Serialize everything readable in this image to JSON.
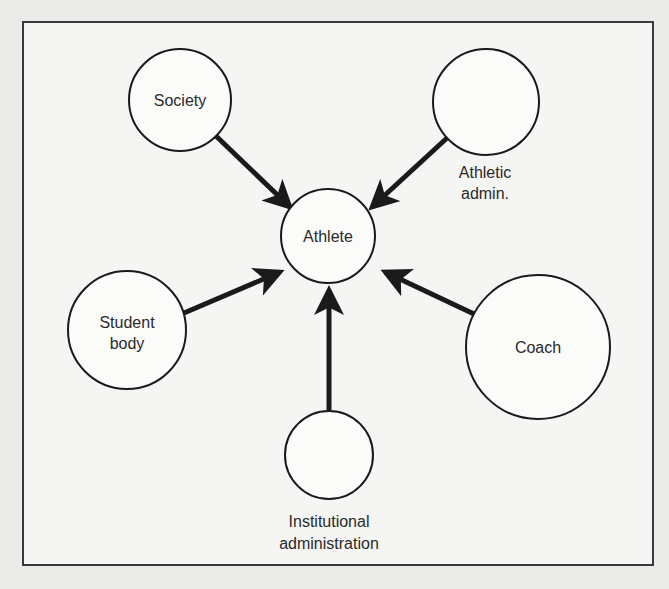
{
  "diagram": {
    "center": {
      "id": "athlete",
      "label": "Athlete"
    },
    "nodes": [
      {
        "id": "society",
        "label_lines": [
          "Society"
        ],
        "label_position": "inside"
      },
      {
        "id": "athletic-admin",
        "label_lines": [
          "Athletic",
          "admin."
        ],
        "label_position": "below"
      },
      {
        "id": "student-body",
        "label_lines": [
          "Student",
          "body"
        ],
        "label_position": "inside"
      },
      {
        "id": "coach",
        "label_lines": [
          "Coach"
        ],
        "label_position": "inside"
      },
      {
        "id": "institutional-administration",
        "label_lines": [
          "Institutional",
          "administration"
        ],
        "label_position": "below"
      }
    ],
    "edges": [
      {
        "from": "society",
        "to": "athlete"
      },
      {
        "from": "athletic-admin",
        "to": "athlete"
      },
      {
        "from": "student-body",
        "to": "athlete"
      },
      {
        "from": "coach",
        "to": "athlete"
      },
      {
        "from": "institutional-administration",
        "to": "athlete"
      }
    ]
  }
}
